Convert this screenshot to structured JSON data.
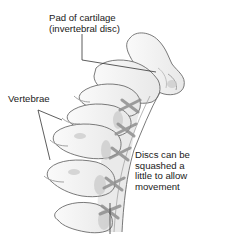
{
  "diagram": {
    "labels": {
      "pad": {
        "line1": "Pad of cartilage",
        "line2": "(invertebral disc)"
      },
      "vertebrae": {
        "text": "Vertebrae"
      },
      "discs": {
        "line1": "Discs can be",
        "line2": "squashed a",
        "line3": "little to allow",
        "line4": "movement"
      }
    },
    "colors": {
      "background": "#ffffff",
      "outline": "#6b6b6b",
      "bone_fill": "#f4f4f4",
      "shade": "#c9c9c9",
      "ligament": "#8f8f8f",
      "leader": "#333333",
      "text": "#1a1a1a"
    }
  }
}
